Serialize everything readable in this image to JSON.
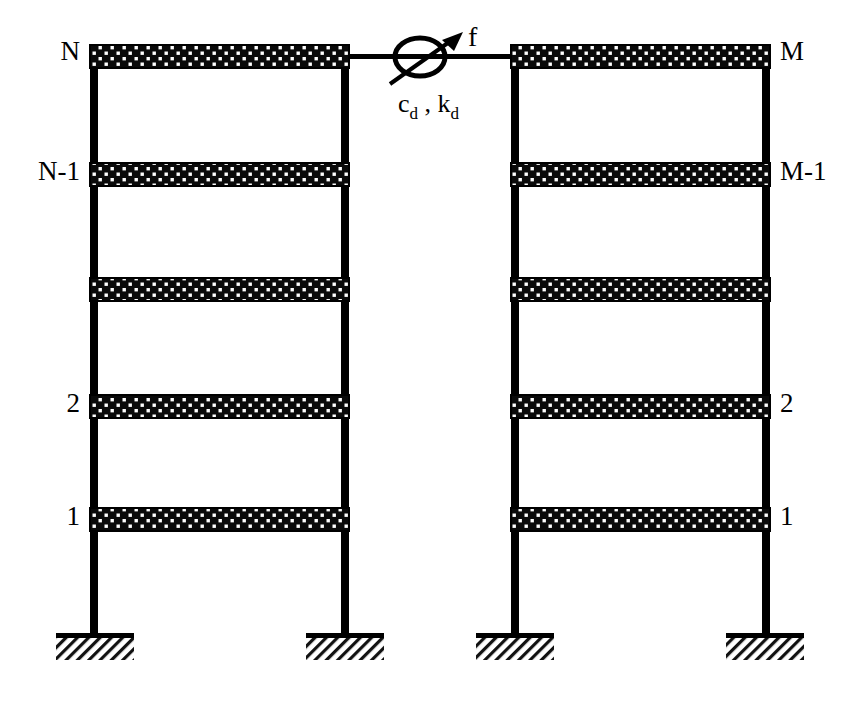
{
  "figure": {
    "background_color": "#ffffff",
    "line_color": "#000000",
    "slab_fill_color": "#0a0a0a",
    "slab_dot_color": "#ffffff"
  },
  "damper": {
    "label": "c",
    "label_sub_1": "d",
    "label_sep": " , ",
    "label_2": "k",
    "label_sub_2": "d",
    "force_label": "f",
    "symbol": "damper-ellipse-icon",
    "arrow": "force-arrow-icon"
  },
  "left_structure": {
    "name": "left-frame",
    "storey_labels": [
      "N",
      "N-1",
      "",
      "2",
      "1"
    ],
    "label_side": "left",
    "column_x": [
      95,
      345
    ],
    "slab_y": [
      45,
      163,
      278,
      395,
      508
    ],
    "base_y": 637
  },
  "right_structure": {
    "name": "right-frame",
    "storey_labels": [
      "M",
      "M-1",
      "",
      "2",
      "1"
    ],
    "label_side": "right",
    "column_x": [
      515,
      765
    ],
    "slab_y": [
      45,
      163,
      278,
      395,
      508
    ],
    "base_y": 637
  },
  "supports": {
    "name": "fixed-support",
    "count": 4,
    "x_centers": [
      95,
      345,
      515,
      765
    ],
    "y": 637,
    "plate_width": 78,
    "hatch_height": 22
  }
}
